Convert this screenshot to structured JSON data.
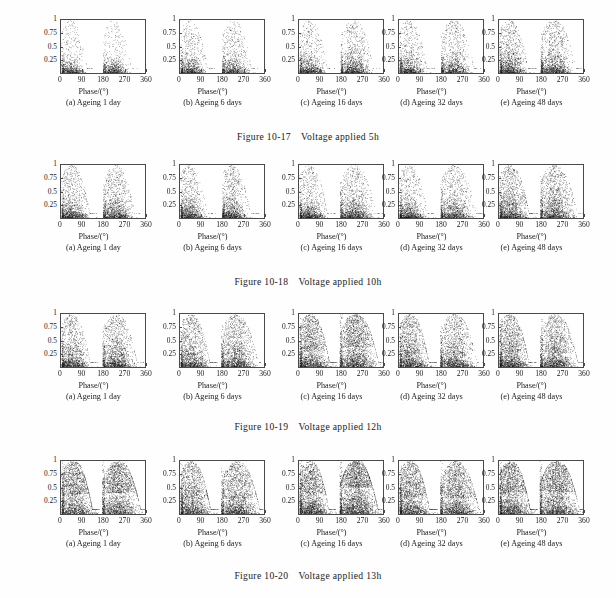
{
  "page": {
    "background_color": "#fefefe",
    "ink_color": "#1a1a1a"
  },
  "axis": {
    "xlabel": "Phase/(°)",
    "ytick_labels": [
      "1",
      "0.75",
      "0.5",
      "0.25"
    ],
    "ytick_values": [
      1,
      0.75,
      0.5,
      0.25
    ],
    "xtick_labels": [
      "0",
      "90",
      "180",
      "270",
      "360"
    ],
    "xtick_values": [
      0,
      90,
      180,
      270,
      360
    ],
    "xlim": [
      0,
      360
    ],
    "ylim": [
      0,
      1
    ],
    "grid": false
  },
  "subplot_captions": [
    "(a) Ageing 1 day",
    "(b) Ageing 6 days",
    "(c) Ageing 16 days",
    "(d) Ageing 32 days",
    "(e) Ageing 48 days"
  ],
  "figures": [
    {
      "number": "Figure 10-17",
      "title": "Voltage applied 5h",
      "caption": "Figure 10-17    Voltage applied 5h"
    },
    {
      "number": "Figure 10-18",
      "title": "Voltage applied 10h",
      "caption": "Figure 10-18    Voltage applied 10h"
    },
    {
      "number": "Figure 10-19",
      "title": "Voltage applied 12h",
      "caption": "Figure 10-19    Voltage applied 12h"
    },
    {
      "number": "Figure 10-20",
      "title": "Voltage applied 13h",
      "caption": "Figure 10-20    Voltage applied 13h"
    }
  ],
  "chart_data": {
    "type": "scatter",
    "xlabel": "Phase/(°)",
    "ylabel": "",
    "xlim": [
      0,
      360
    ],
    "ylim": [
      0,
      1
    ],
    "xticks": [
      0,
      90,
      180,
      270,
      360
    ],
    "yticks": [
      0.25,
      0.5,
      0.75,
      1
    ],
    "grid": false,
    "legend": null,
    "marker": {
      "color": "#111111",
      "size": 1,
      "shape": "dot"
    },
    "panels": [
      {
        "figure": "Figure 10-17",
        "figure_title": "Voltage applied 5h",
        "subplots": [
          {
            "label": "(a) Ageing 1 day",
            "n_points": 2100,
            "lobes": [
              {
                "phase_center": 38,
                "phase_spread": 30,
                "phase_min": 2,
                "phase_max": 140,
                "amp_scale": 0.16,
                "amp_max": 1.0,
                "tail_fraction": 0.16,
                "weight": 0.5
              },
              {
                "phase_center": 220,
                "phase_spread": 30,
                "phase_min": 176,
                "phase_max": 320,
                "amp_scale": 0.16,
                "amp_max": 1.0,
                "tail_fraction": 0.16,
                "weight": 0.5
              }
            ]
          },
          {
            "label": "(b) Ageing 6 days",
            "n_points": 2400,
            "lobes": [
              {
                "phase_center": 40,
                "phase_spread": 32,
                "phase_min": 2,
                "phase_max": 145,
                "amp_scale": 0.18,
                "amp_max": 1.0,
                "tail_fraction": 0.22,
                "weight": 0.5
              },
              {
                "phase_center": 222,
                "phase_spread": 32,
                "phase_min": 176,
                "phase_max": 325,
                "amp_scale": 0.18,
                "amp_max": 1.0,
                "tail_fraction": 0.22,
                "weight": 0.5
              }
            ]
          },
          {
            "label": "(c) Ageing 16 days",
            "n_points": 2800,
            "lobes": [
              {
                "phase_center": 42,
                "phase_spread": 33,
                "phase_min": 2,
                "phase_max": 150,
                "amp_scale": 0.19,
                "amp_max": 1.0,
                "tail_fraction": 0.2,
                "weight": 0.46
              },
              {
                "phase_center": 226,
                "phase_spread": 34,
                "phase_min": 174,
                "phase_max": 340,
                "amp_scale": 0.21,
                "amp_max": 1.0,
                "tail_fraction": 0.24,
                "weight": 0.54
              }
            ]
          },
          {
            "label": "(d) Ageing 32 days",
            "n_points": 2600,
            "lobes": [
              {
                "phase_center": 40,
                "phase_spread": 32,
                "phase_min": 2,
                "phase_max": 150,
                "amp_scale": 0.2,
                "amp_max": 1.0,
                "tail_fraction": 0.22,
                "weight": 0.48
              },
              {
                "phase_center": 228,
                "phase_spread": 33,
                "phase_min": 176,
                "phase_max": 345,
                "amp_scale": 0.2,
                "amp_max": 1.0,
                "tail_fraction": 0.24,
                "weight": 0.52
              }
            ]
          },
          {
            "label": "(e) Ageing 48 days",
            "n_points": 3200,
            "lobes": [
              {
                "phase_center": 42,
                "phase_spread": 34,
                "phase_min": 2,
                "phase_max": 155,
                "amp_scale": 0.22,
                "amp_max": 1.0,
                "tail_fraction": 0.26,
                "weight": 0.5
              },
              {
                "phase_center": 230,
                "phase_spread": 35,
                "phase_min": 174,
                "phase_max": 350,
                "amp_scale": 0.22,
                "amp_max": 1.0,
                "tail_fraction": 0.26,
                "weight": 0.5
              }
            ]
          }
        ]
      },
      {
        "figure": "Figure 10-18",
        "figure_title": "Voltage applied 10h",
        "subplots": [
          {
            "label": "(a) Ageing 1 day",
            "n_points": 3000,
            "lobes": [
              {
                "phase_center": 44,
                "phase_spread": 34,
                "phase_min": 2,
                "phase_max": 150,
                "amp_scale": 0.2,
                "amp_max": 1.0,
                "tail_fraction": 0.26,
                "weight": 0.5
              },
              {
                "phase_center": 228,
                "phase_spread": 34,
                "phase_min": 176,
                "phase_max": 330,
                "amp_scale": 0.21,
                "amp_max": 1.0,
                "tail_fraction": 0.28,
                "weight": 0.5
              }
            ]
          },
          {
            "label": "(b) Ageing 6 days",
            "n_points": 2900,
            "lobes": [
              {
                "phase_center": 38,
                "phase_spread": 30,
                "phase_min": 2,
                "phase_max": 150,
                "amp_scale": 0.2,
                "amp_max": 1.0,
                "tail_fraction": 0.24,
                "weight": 0.5
              },
              {
                "phase_center": 215,
                "phase_spread": 28,
                "phase_min": 176,
                "phase_max": 330,
                "amp_scale": 0.2,
                "amp_max": 1.0,
                "tail_fraction": 0.26,
                "weight": 0.5
              }
            ]
          },
          {
            "label": "(c) Ageing 16 days",
            "n_points": 3200,
            "lobes": [
              {
                "phase_center": 40,
                "phase_spread": 32,
                "phase_min": 2,
                "phase_max": 155,
                "amp_scale": 0.19,
                "amp_max": 1.0,
                "tail_fraction": 0.22,
                "weight": 0.46
              },
              {
                "phase_center": 228,
                "phase_spread": 36,
                "phase_min": 172,
                "phase_max": 355,
                "amp_scale": 0.22,
                "amp_max": 1.0,
                "tail_fraction": 0.26,
                "weight": 0.54
              }
            ]
          },
          {
            "label": "(d) Ageing 32 days",
            "n_points": 3000,
            "lobes": [
              {
                "phase_center": 40,
                "phase_spread": 32,
                "phase_min": 2,
                "phase_max": 155,
                "amp_scale": 0.2,
                "amp_max": 1.0,
                "tail_fraction": 0.24,
                "weight": 0.48
              },
              {
                "phase_center": 230,
                "phase_spread": 36,
                "phase_min": 174,
                "phase_max": 355,
                "amp_scale": 0.21,
                "amp_max": 1.0,
                "tail_fraction": 0.26,
                "weight": 0.52
              }
            ]
          },
          {
            "label": "(e) Ageing 48 days",
            "n_points": 3600,
            "lobes": [
              {
                "phase_center": 44,
                "phase_spread": 36,
                "phase_min": 2,
                "phase_max": 160,
                "amp_scale": 0.26,
                "amp_max": 1.0,
                "tail_fraction": 0.3,
                "weight": 0.5
              },
              {
                "phase_center": 232,
                "phase_spread": 36,
                "phase_min": 172,
                "phase_max": 358,
                "amp_scale": 0.26,
                "amp_max": 1.0,
                "tail_fraction": 0.3,
                "weight": 0.5
              }
            ]
          }
        ]
      },
      {
        "figure": "Figure 10-19",
        "figure_title": "Voltage applied 12h",
        "subplots": [
          {
            "label": "(a) Ageing 1 day",
            "n_points": 3400,
            "lobes": [
              {
                "phase_center": 42,
                "phase_spread": 34,
                "phase_min": 2,
                "phase_max": 155,
                "amp_scale": 0.24,
                "amp_max": 1.0,
                "tail_fraction": 0.28,
                "weight": 0.48
              },
              {
                "phase_center": 230,
                "phase_spread": 36,
                "phase_min": 174,
                "phase_max": 345,
                "amp_scale": 0.26,
                "amp_max": 1.0,
                "tail_fraction": 0.3,
                "weight": 0.52
              }
            ]
          },
          {
            "label": "(b) Ageing 6 days",
            "n_points": 3600,
            "lobes": [
              {
                "phase_center": 44,
                "phase_spread": 36,
                "phase_min": 2,
                "phase_max": 158,
                "amp_scale": 0.26,
                "amp_max": 1.0,
                "tail_fraction": 0.3,
                "weight": 0.48
              },
              {
                "phase_center": 232,
                "phase_spread": 36,
                "phase_min": 172,
                "phase_max": 355,
                "amp_scale": 0.26,
                "amp_max": 1.0,
                "tail_fraction": 0.3,
                "weight": 0.52
              }
            ]
          },
          {
            "label": "(c) Ageing 16 days",
            "n_points": 4400,
            "lobes": [
              {
                "phase_center": 46,
                "phase_spread": 36,
                "phase_min": 2,
                "phase_max": 160,
                "amp_scale": 0.34,
                "amp_max": 1.0,
                "tail_fraction": 0.34,
                "weight": 0.46
              },
              {
                "phase_center": 236,
                "phase_spread": 40,
                "phase_min": 170,
                "phase_max": 358,
                "amp_scale": 0.4,
                "amp_max": 1.0,
                "tail_fraction": 0.36,
                "weight": 0.54
              }
            ]
          },
          {
            "label": "(d) Ageing 32 days",
            "n_points": 3800,
            "lobes": [
              {
                "phase_center": 44,
                "phase_spread": 36,
                "phase_min": 2,
                "phase_max": 158,
                "amp_scale": 0.28,
                "amp_max": 1.0,
                "tail_fraction": 0.34,
                "weight": 0.5
              },
              {
                "phase_center": 232,
                "phase_spread": 36,
                "phase_min": 172,
                "phase_max": 356,
                "amp_scale": 0.26,
                "amp_max": 1.0,
                "tail_fraction": 0.32,
                "weight": 0.5
              }
            ]
          },
          {
            "label": "(e) Ageing 48 days",
            "n_points": 4000,
            "lobes": [
              {
                "phase_center": 44,
                "phase_spread": 36,
                "phase_min": 2,
                "phase_max": 158,
                "amp_scale": 0.3,
                "amp_max": 1.0,
                "tail_fraction": 0.34,
                "weight": 0.5
              },
              {
                "phase_center": 234,
                "phase_spread": 38,
                "phase_min": 172,
                "phase_max": 358,
                "amp_scale": 0.3,
                "amp_max": 1.0,
                "tail_fraction": 0.34,
                "weight": 0.5
              }
            ]
          }
        ]
      },
      {
        "figure": "Figure 10-20",
        "figure_title": "Voltage applied 13h",
        "subplots": [
          {
            "label": "(a) Ageing 1 day",
            "n_points": 4600,
            "lobes": [
              {
                "phase_center": 50,
                "phase_spread": 40,
                "phase_min": 2,
                "phase_max": 160,
                "amp_scale": 0.4,
                "amp_max": 1.0,
                "tail_fraction": 0.42,
                "weight": 0.48
              },
              {
                "phase_center": 238,
                "phase_spread": 40,
                "phase_min": 172,
                "phase_max": 358,
                "amp_scale": 0.42,
                "amp_max": 1.0,
                "tail_fraction": 0.44,
                "weight": 0.52
              }
            ]
          },
          {
            "label": "(b) Ageing 6 days",
            "n_points": 4200,
            "lobes": [
              {
                "phase_center": 46,
                "phase_spread": 38,
                "phase_min": 2,
                "phase_max": 160,
                "amp_scale": 0.32,
                "amp_max": 1.0,
                "tail_fraction": 0.36,
                "weight": 0.48
              },
              {
                "phase_center": 238,
                "phase_spread": 40,
                "phase_min": 172,
                "phase_max": 358,
                "amp_scale": 0.32,
                "amp_max": 1.0,
                "tail_fraction": 0.38,
                "weight": 0.52
              }
            ]
          },
          {
            "label": "(c) Ageing 16 days",
            "n_points": 5200,
            "lobes": [
              {
                "phase_center": 46,
                "phase_spread": 36,
                "phase_min": 2,
                "phase_max": 155,
                "amp_scale": 0.42,
                "amp_max": 1.0,
                "tail_fraction": 0.3,
                "weight": 0.42
              },
              {
                "phase_center": 238,
                "phase_spread": 40,
                "phase_min": 170,
                "phase_max": 350,
                "amp_scale": 0.52,
                "amp_max": 1.0,
                "tail_fraction": 0.32,
                "weight": 0.58
              }
            ]
          },
          {
            "label": "(d) Ageing 32 days",
            "n_points": 4400,
            "lobes": [
              {
                "phase_center": 46,
                "phase_spread": 38,
                "phase_min": 2,
                "phase_max": 160,
                "amp_scale": 0.34,
                "amp_max": 1.0,
                "tail_fraction": 0.4,
                "weight": 0.48
              },
              {
                "phase_center": 238,
                "phase_spread": 40,
                "phase_min": 172,
                "phase_max": 358,
                "amp_scale": 0.32,
                "amp_max": 1.0,
                "tail_fraction": 0.4,
                "weight": 0.52
              }
            ]
          },
          {
            "label": "(e) Ageing 48 days",
            "n_points": 5000,
            "lobes": [
              {
                "phase_center": 48,
                "phase_spread": 40,
                "phase_min": 2,
                "phase_max": 162,
                "amp_scale": 0.42,
                "amp_max": 1.0,
                "tail_fraction": 0.38,
                "weight": 0.48
              },
              {
                "phase_center": 240,
                "phase_spread": 42,
                "phase_min": 170,
                "phase_max": 358,
                "amp_scale": 0.44,
                "amp_max": 1.0,
                "tail_fraction": 0.4,
                "weight": 0.52
              }
            ]
          }
        ]
      }
    ]
  }
}
